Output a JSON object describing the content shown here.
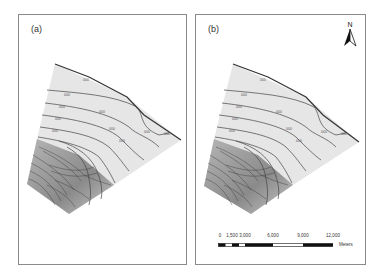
{
  "figure": {
    "panels": [
      {
        "label": "(a)"
      },
      {
        "label": "(b)"
      }
    ],
    "north_arrow": {
      "label": "N",
      "icon": "north-arrow-icon"
    },
    "scale_bar": {
      "ticks": [
        "0",
        "1,500",
        "3,000",
        "6,000",
        "9,000",
        "12,000"
      ],
      "unit": "Meters"
    },
    "colors": {
      "frame": "#8a8a8a",
      "upper_region_fill": "#e4e4e4",
      "lower_region_fill": "#9a9a9a",
      "contour": "#444444"
    }
  }
}
